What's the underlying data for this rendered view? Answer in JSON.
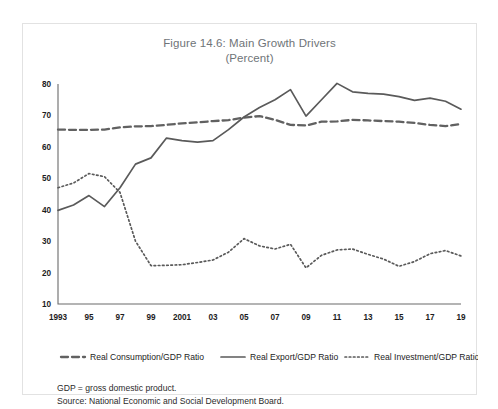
{
  "figure": {
    "title": "Figure 14.6: Main Growth Drivers",
    "subtitle": "(Percent)",
    "note_definition": "GDP = gross domestic product.",
    "note_source": "Source: National Economic and Social Development Board."
  },
  "colors": {
    "title": "#6f7478",
    "line": "#5a5a5a",
    "axis": "#6b6b6b",
    "frame": "#e2e2e2",
    "background": "#ffffff"
  },
  "chart_data": {
    "type": "line",
    "title": "Figure 14.6: Main Growth Drivers",
    "subtitle": "(Percent)",
    "xlabel": "",
    "ylabel": "",
    "ylim": [
      10,
      80
    ],
    "yticks": [
      10,
      20,
      30,
      40,
      50,
      60,
      70,
      80
    ],
    "ytick_labels": [
      "10",
      "20",
      "30",
      "40",
      "50",
      "60",
      "70",
      "80"
    ],
    "grid": false,
    "legend_position": "bottom",
    "x": [
      1993,
      1994,
      1995,
      1996,
      1997,
      1998,
      1999,
      2000,
      2001,
      2002,
      2003,
      2004,
      2005,
      2006,
      2007,
      2008,
      2009,
      2010,
      2011,
      2012,
      2013,
      2014,
      2015,
      2016,
      2017,
      2018,
      2019
    ],
    "xtick_positions": [
      1993,
      1995,
      1997,
      1999,
      2001,
      2003,
      2005,
      2007,
      2009,
      2011,
      2013,
      2015,
      2017,
      2019
    ],
    "xtick_labels": [
      "1993",
      "95",
      "97",
      "99",
      "2001",
      "03",
      "05",
      "07",
      "09",
      "11",
      "13",
      "15",
      "17",
      "19"
    ],
    "series": [
      {
        "name": "Real Consumption/GDP Ratio",
        "style": "dashed",
        "values": [
          65.5,
          65.4,
          65.4,
          65.5,
          66.2,
          66.5,
          66.6,
          67.0,
          67.5,
          67.8,
          68.2,
          68.5,
          69.3,
          69.8,
          68.6,
          67.0,
          66.8,
          68.0,
          68.1,
          68.6,
          68.4,
          68.2,
          68.0,
          67.6,
          67.0,
          66.6,
          67.3
        ]
      },
      {
        "name": "Real Export/GDP Ratio",
        "style": "solid",
        "values": [
          39.8,
          41.5,
          44.5,
          41.0,
          47.0,
          54.5,
          56.5,
          62.8,
          62.0,
          61.5,
          62.0,
          65.5,
          69.5,
          72.5,
          75.0,
          78.2,
          69.8,
          75.0,
          80.2,
          77.5,
          77.0,
          76.8,
          76.0,
          74.8,
          75.5,
          74.5,
          72.0
        ]
      },
      {
        "name": "Real Investment/GDP Ratio",
        "style": "dotted",
        "values": [
          47.0,
          48.5,
          51.5,
          50.5,
          45.5,
          30.0,
          22.2,
          22.3,
          22.5,
          23.2,
          24.0,
          26.5,
          30.8,
          28.5,
          27.5,
          29.0,
          21.5,
          25.5,
          27.2,
          27.5,
          25.8,
          24.3,
          22.0,
          23.5,
          26.0,
          27.0,
          25.3
        ]
      }
    ],
    "legend": [
      {
        "label": "Real Consumption/GDP Ratio",
        "style": "dashed"
      },
      {
        "label": "Real Export/GDP Ratio",
        "style": "solid"
      },
      {
        "label": "Real Investment/GDP Ratio",
        "style": "dotted"
      }
    ]
  }
}
